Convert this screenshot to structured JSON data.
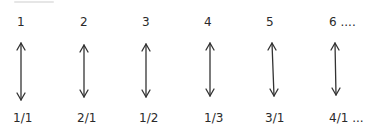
{
  "diagram": {
    "naturals": [
      "1",
      "2",
      "3",
      "4",
      "5",
      "6 ...."
    ],
    "rationals": [
      "1/1",
      "2/1",
      "1/2",
      "1/3",
      "3/1",
      "4/1 ..."
    ],
    "arrow_type": "double-headed-vertical",
    "colors": {
      "text": "#2a2a2a",
      "arrow": "#333333",
      "background": "#ffffff"
    }
  }
}
